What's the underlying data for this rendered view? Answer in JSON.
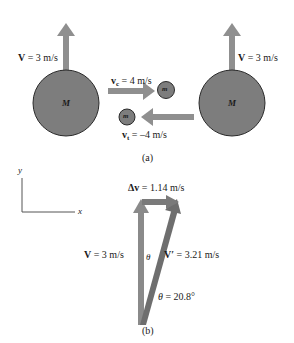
{
  "figure": {
    "panel_a": {
      "caption": "(a)",
      "left_body": {
        "mass_label": "M",
        "velocity_label": "V = 3 m/s",
        "velocity_symbol": "V",
        "velocity_value": "= 3 m/s"
      },
      "right_body": {
        "mass_label": "M",
        "velocity_label": "V = 3 m/s",
        "velocity_symbol": "V",
        "velocity_value": "= 3 m/s"
      },
      "incoming_particle": {
        "mass_label": "m",
        "velocity_symbol": "v",
        "velocity_subscript": "c",
        "velocity_value": "= 4 m/s"
      },
      "outgoing_particle": {
        "mass_label": "m",
        "velocity_symbol": "v",
        "velocity_subscript": "t",
        "velocity_value": "= –4 m/s"
      }
    },
    "axes": {
      "x_label": "x",
      "y_label": "y"
    },
    "panel_b": {
      "caption": "(b)",
      "delta_v": {
        "symbol": "Δv",
        "value": "= 1.14 m/s"
      },
      "initial_velocity": {
        "symbol": "V",
        "value": "= 3 m/s"
      },
      "final_velocity": {
        "symbol": "V′",
        "value": "= 3.21 m/s"
      },
      "angle_symbol": "θ",
      "angle_label": {
        "symbol": "θ",
        "value": "= 20.8°"
      }
    },
    "colors": {
      "body_fill": "#7d7d7d",
      "body_stroke": "#2a2a2a",
      "arrow": "#8f8f8f",
      "triangle_fill": "#6e6e6e",
      "axis": "#555555",
      "text": "#1a1a1a"
    }
  }
}
